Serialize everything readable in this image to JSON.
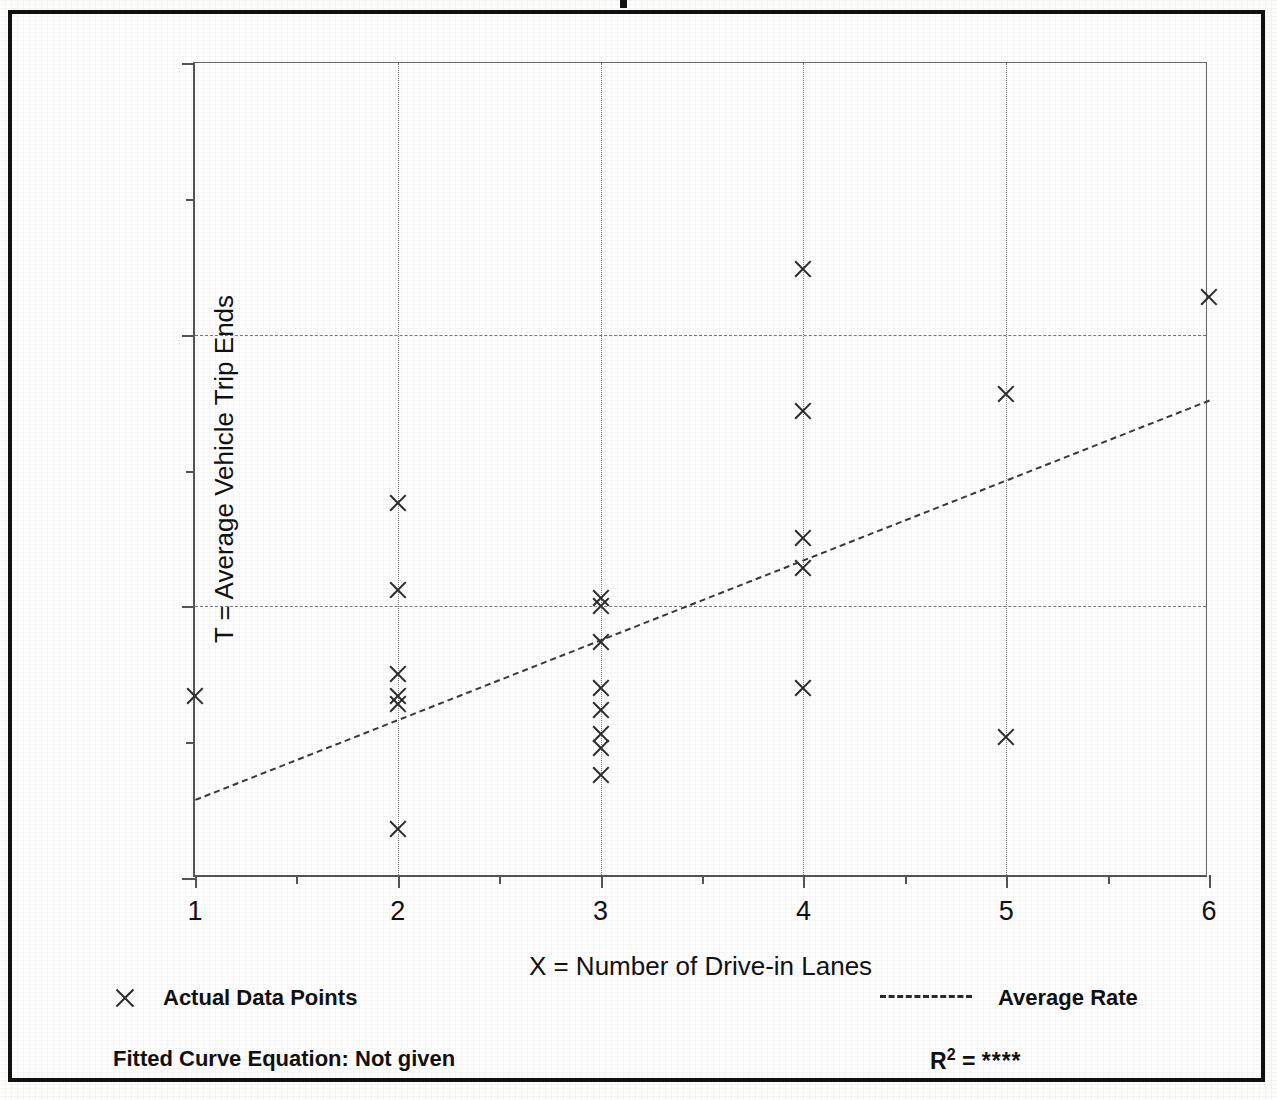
{
  "axes": {
    "y_title": "T = Average Vehicle Trip Ends",
    "x_title": "X = Number of Drive-in Lanes",
    "y_ticks": [
      "300",
      "200",
      "100",
      "0"
    ],
    "x_ticks": [
      "1",
      "2",
      "3",
      "4",
      "5",
      "6"
    ]
  },
  "legend": {
    "data_points_label": "Actual Data Points",
    "average_rate_label": "Average Rate",
    "fitted_curve_label": "Fitted Curve Equation:  Not given",
    "r_squared_prefix": "R",
    "r_squared_exponent": "2",
    "r_squared_equals": " = ",
    "r_squared_value": "****"
  },
  "colors": {
    "marker": "#2b2b2b",
    "trend": "#3a3a3a",
    "grid": "#777777",
    "axis": "#555555",
    "frame": "#111111"
  },
  "chart_data": {
    "type": "scatter",
    "title": "",
    "xlabel": "X = Number of Drive-in Lanes",
    "ylabel": "T = Average Vehicle Trip Ends",
    "xlim": [
      1,
      6
    ],
    "ylim": [
      0,
      300
    ],
    "x_major_ticks": [
      1,
      2,
      3,
      4,
      5,
      6
    ],
    "x_minor_ticks": [
      1.5,
      2.5,
      3.5,
      4.5,
      5.5
    ],
    "y_major_ticks": [
      0,
      100,
      200,
      300
    ],
    "y_minor_ticks": [
      50,
      150,
      250
    ],
    "grid": {
      "horizontal": [
        100,
        200
      ],
      "vertical": [
        2,
        3,
        4,
        5
      ],
      "style": "dashed-dotted"
    },
    "legend_position": "below-plot",
    "series": [
      {
        "name": "Actual Data Points",
        "marker": "x",
        "points": [
          {
            "x": 1,
            "y": 67
          },
          {
            "x": 2,
            "y": 138
          },
          {
            "x": 2,
            "y": 106
          },
          {
            "x": 2,
            "y": 75
          },
          {
            "x": 2,
            "y": 67
          },
          {
            "x": 2,
            "y": 64
          },
          {
            "x": 2,
            "y": 18
          },
          {
            "x": 3,
            "y": 103
          },
          {
            "x": 3,
            "y": 100
          },
          {
            "x": 3,
            "y": 87
          },
          {
            "x": 3,
            "y": 70
          },
          {
            "x": 3,
            "y": 62
          },
          {
            "x": 3,
            "y": 53
          },
          {
            "x": 3,
            "y": 48
          },
          {
            "x": 3,
            "y": 38
          },
          {
            "x": 4,
            "y": 224
          },
          {
            "x": 4,
            "y": 172
          },
          {
            "x": 4,
            "y": 125
          },
          {
            "x": 4,
            "y": 114
          },
          {
            "x": 4,
            "y": 70
          },
          {
            "x": 5,
            "y": 178
          },
          {
            "x": 5,
            "y": 52
          },
          {
            "x": 6,
            "y": 214
          }
        ]
      },
      {
        "name": "Average Rate",
        "type": "line",
        "style": "dashed",
        "points": [
          {
            "x": 1,
            "y": 29
          },
          {
            "x": 6,
            "y": 176
          }
        ]
      }
    ]
  }
}
